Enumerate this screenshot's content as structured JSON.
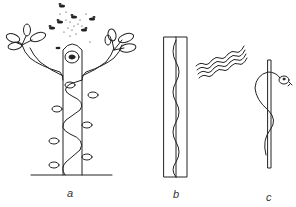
{
  "figure": {
    "panels": [
      {
        "id": "a",
        "label": "a",
        "description": "Plant with central eye, climbing vine spiraling around pole, swarm of insects above"
      },
      {
        "id": "b",
        "label": "b",
        "description": "Rectangle containing a wavy line, with group of parallel wavy lines beside it"
      },
      {
        "id": "c",
        "label": "c",
        "description": "Snake coiled around a vertical rod"
      }
    ],
    "colors": {
      "line": "#222222",
      "background": "#ffffff"
    }
  }
}
